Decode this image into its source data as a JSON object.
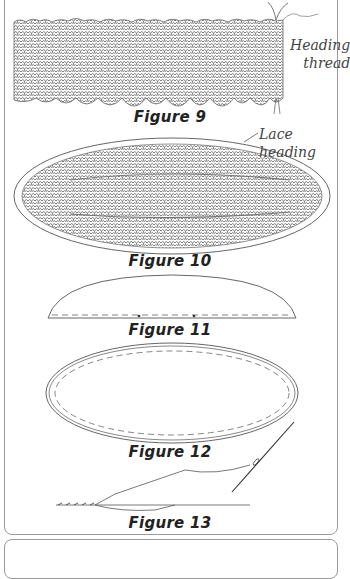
{
  "figures": [
    {
      "id": 9,
      "caption": "Figure 9",
      "description": "lace strip with heading thread pulled to gather"
    },
    {
      "id": 10,
      "caption": "Figure 10",
      "description": "oval of gathered lace inside lace heading"
    },
    {
      "id": 11,
      "caption": "Figure 11",
      "description": "half-oval template with dashed seam line and center marks"
    },
    {
      "id": 12,
      "caption": "Figure 12",
      "description": "oval outline with inner dashed seam line"
    },
    {
      "id": 13,
      "caption": "Figure 13",
      "description": "needle and thread whip stitch along edge"
    }
  ],
  "labels": {
    "heading_thread_line1": "Heading",
    "heading_thread_line2": "thread",
    "lace_heading": "Lace heading"
  },
  "colors": {
    "line": "#555555",
    "caption": "#222222",
    "border": "#9a9a9a"
  }
}
